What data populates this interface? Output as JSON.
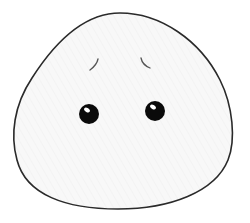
{
  "illustration": {
    "subject": "worried blob face",
    "colors": {
      "background": "#ffffff",
      "body_fill": "#f7f7f7",
      "outline": "#2a2a2a",
      "eye": "#0a0a0a",
      "eye_highlight": "#ffffff",
      "brow": "#555555"
    },
    "parts": {
      "body": "rounded-triangle-blob",
      "left_brow": "worried-brow-left",
      "right_brow": "worried-brow-right",
      "left_eye": "eye-left",
      "right_eye": "eye-right"
    }
  }
}
